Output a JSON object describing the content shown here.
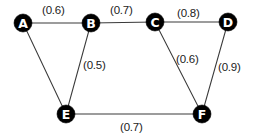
{
  "diagram": {
    "background_color": "#ffffff",
    "node_fill_color": "#000000",
    "node_label_color": "#ffffff",
    "edge_color": "#3a3a3a",
    "weight_text_color": "#1c1c1c",
    "nodes": [
      {
        "id": "A",
        "label": "A",
        "cx": 23,
        "cy": 23,
        "r": 9
      },
      {
        "id": "B",
        "label": "B",
        "cx": 91,
        "cy": 23,
        "r": 9
      },
      {
        "id": "C",
        "label": "C",
        "cx": 155,
        "cy": 22,
        "r": 9
      },
      {
        "id": "D",
        "label": "D",
        "cx": 228,
        "cy": 22,
        "r": 9
      },
      {
        "id": "E",
        "label": "E",
        "cx": 66,
        "cy": 114,
        "r": 9
      },
      {
        "id": "F",
        "label": "F",
        "cx": 202,
        "cy": 114,
        "r": 9
      }
    ],
    "edges": [
      {
        "id": "A-B",
        "from": "A",
        "to": "B",
        "weight": "(0.6)",
        "value": 0.6,
        "label_x": 42,
        "label_y": 4
      },
      {
        "id": "B-C",
        "from": "B",
        "to": "C",
        "weight": "(0.7)",
        "value": 0.7,
        "label_x": 110,
        "label_y": 4
      },
      {
        "id": "C-D",
        "from": "C",
        "to": "D",
        "weight": "(0.8)",
        "value": 0.8,
        "label_x": 177,
        "label_y": 7
      },
      {
        "id": "B-E",
        "from": "B",
        "to": "E",
        "weight": "(0.5)",
        "value": 0.5,
        "label_x": 83,
        "label_y": 59
      },
      {
        "id": "C-F",
        "from": "C",
        "to": "F",
        "weight": "(0.6)",
        "value": 0.6,
        "label_x": 176,
        "label_y": 53
      },
      {
        "id": "D-F",
        "from": "D",
        "to": "F",
        "weight": "(0.9)",
        "value": 0.9,
        "label_x": 218,
        "label_y": 61
      },
      {
        "id": "E-F",
        "from": "E",
        "to": "F",
        "weight": "(0.7)",
        "value": 0.7,
        "label_x": 120,
        "label_y": 121
      },
      {
        "id": "A-E",
        "from": "A",
        "to": "E",
        "weight": "",
        "value": null,
        "label_x": null,
        "label_y": null
      }
    ]
  }
}
